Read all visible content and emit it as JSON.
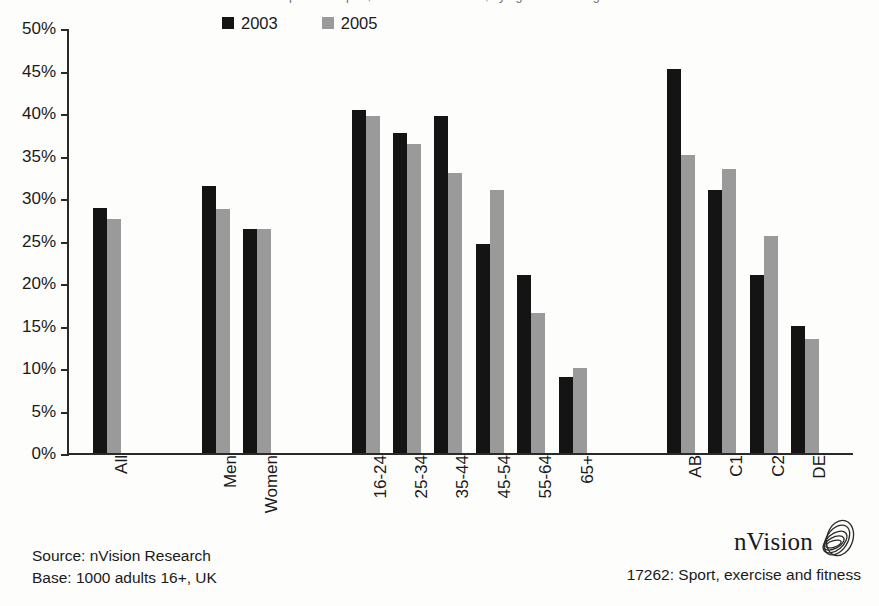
{
  "title": {
    "text": "Participation in sport, exercise and fitness, by age and social grade"
  },
  "legend": {
    "position": "top-center",
    "entries": [
      {
        "label": "2003",
        "color": "#141414",
        "icon": "legend-swatch"
      },
      {
        "label": "2005",
        "color": "#9a9a9a",
        "icon": "legend-swatch"
      }
    ]
  },
  "footer": {
    "source": "Source: nVision Research",
    "base": "Base: 1000 adults 16+, UK",
    "brand": "nVision",
    "brand_icon": "nvision-logo-icon",
    "caption": "17262: Sport, exercise and fitness"
  },
  "chart_data": {
    "type": "bar",
    "title": "Participation in sport, exercise and fitness, by age and social grade",
    "xlabel": "",
    "ylabel": "",
    "ylim": [
      0,
      50
    ],
    "ytick_labels": [
      "50%",
      "45%",
      "40%",
      "35%",
      "30%",
      "25%",
      "20%",
      "15%",
      "10%",
      "5%",
      "0%"
    ],
    "ytick_values": [
      50,
      45,
      40,
      35,
      30,
      25,
      20,
      15,
      10,
      5,
      0
    ],
    "grid": false,
    "value_suffix": "%",
    "categories": [
      "All",
      "Men",
      "Women",
      "16-24",
      "25-34",
      "35-44",
      "45-54",
      "55-64",
      "65+",
      "AB",
      "C1",
      "C2",
      "DE"
    ],
    "group_breaks_after": [
      "All",
      "Women",
      "65+"
    ],
    "series": [
      {
        "name": "2003",
        "color": "#141414",
        "values": [
          28.8,
          31.4,
          26.3,
          40.4,
          37.6,
          39.6,
          24.6,
          20.9,
          8.9,
          45.2,
          30.9,
          20.9,
          14.9
        ]
      },
      {
        "name": "2005",
        "color": "#9a9a9a",
        "values": [
          27.5,
          28.7,
          26.3,
          39.7,
          36.4,
          33.0,
          31.0,
          16.5,
          10.0,
          35.1,
          33.4,
          25.5,
          13.4
        ]
      }
    ]
  }
}
